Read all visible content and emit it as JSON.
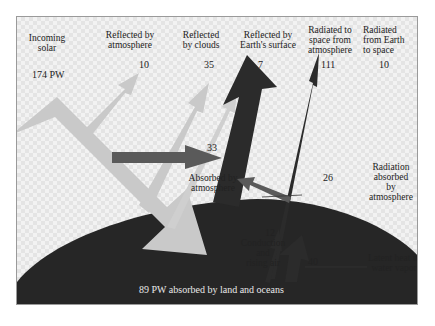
{
  "diagram": {
    "units": "PW",
    "colors": {
      "incoming": "#c8c8c8",
      "absorbed_atmosphere": "#5a5a5a",
      "radiated": "#2b2b2b",
      "ground": "#262626"
    },
    "labels": {
      "incoming_solar": "Incoming\nsolar",
      "incoming_value": "174 PW",
      "reflected_atmosphere": "Reflected by\natmosphere",
      "reflected_atmosphere_value": "10",
      "reflected_clouds": "Reflected\nby clouds",
      "reflected_clouds_value": "35",
      "reflected_surface": "Reflected by\nEarth's surface",
      "reflected_surface_value": "7",
      "radiated_atmosphere": "Radiated to\nspace from\natmosphere",
      "radiated_atmosphere_value": "111",
      "radiated_earth": "Radiated\nfrom Earth\nto space",
      "radiated_earth_value": "10",
      "absorbed_atmosphere": "Absorbed by\natmosphere",
      "absorbed_atmosphere_value": "33",
      "radiation_absorbed": "Radiation\nabsorbed\nby\natmosphere",
      "radiation_absorbed_value": "26",
      "conduction": "Conduction\nand\nrising air",
      "conduction_value": "12",
      "latent_heat": "Latent heat in\nwater vapor",
      "latent_heat_value": "40",
      "ground": "89 PW absorbed by land and oceans"
    }
  }
}
